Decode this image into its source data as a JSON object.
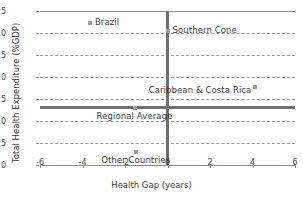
{
  "chart_data": {
    "type": "scatter",
    "title": "",
    "xlabel": "Health Gap (years)",
    "ylabel": "Total Health Expenditure (%GDP)",
    "xlim": [
      -6,
      6
    ],
    "ylim": [
      4.0,
      7.5
    ],
    "xticks": [
      "-6",
      "-4",
      "-2",
      "0",
      "2",
      "4",
      "6"
    ],
    "xtick_values": [
      -6,
      -4,
      -2,
      0,
      2,
      4,
      6
    ],
    "yticks": [
      "4.0",
      "4.5",
      "5.0",
      "5.5",
      "6.0",
      "6.5",
      "7.0",
      "7.5"
    ],
    "ytick_values": [
      4.0,
      4.5,
      5.0,
      5.5,
      6.0,
      6.5,
      7.0,
      7.5
    ],
    "grid": "horizontal-dashed",
    "legend": "none",
    "marker_color": "#9b9b9b",
    "reference_line_color": "#6e6e6e",
    "points": [
      {
        "label": "Brazil",
        "x": -3.65,
        "y": 7.22,
        "label_pos": "right"
      },
      {
        "label": "Southern Cone",
        "x": 0.0,
        "y": 7.05,
        "label_pos": "right"
      },
      {
        "label": "Caribbean & Costa Rica",
        "x": 4.1,
        "y": 5.78,
        "label_pos": "left"
      },
      {
        "label": "Regional Average",
        "x": -1.55,
        "y": 5.3,
        "label_pos": "below"
      },
      {
        "label": "Other Countries",
        "x": -1.5,
        "y": 4.3,
        "label_pos": "below"
      }
    ],
    "reference_lines": [
      {
        "name": "zero-health-gap",
        "orientation": "vertical",
        "value": 0
      },
      {
        "name": "regional-average-expenditure",
        "orientation": "horizontal",
        "value": 5.3
      }
    ]
  }
}
